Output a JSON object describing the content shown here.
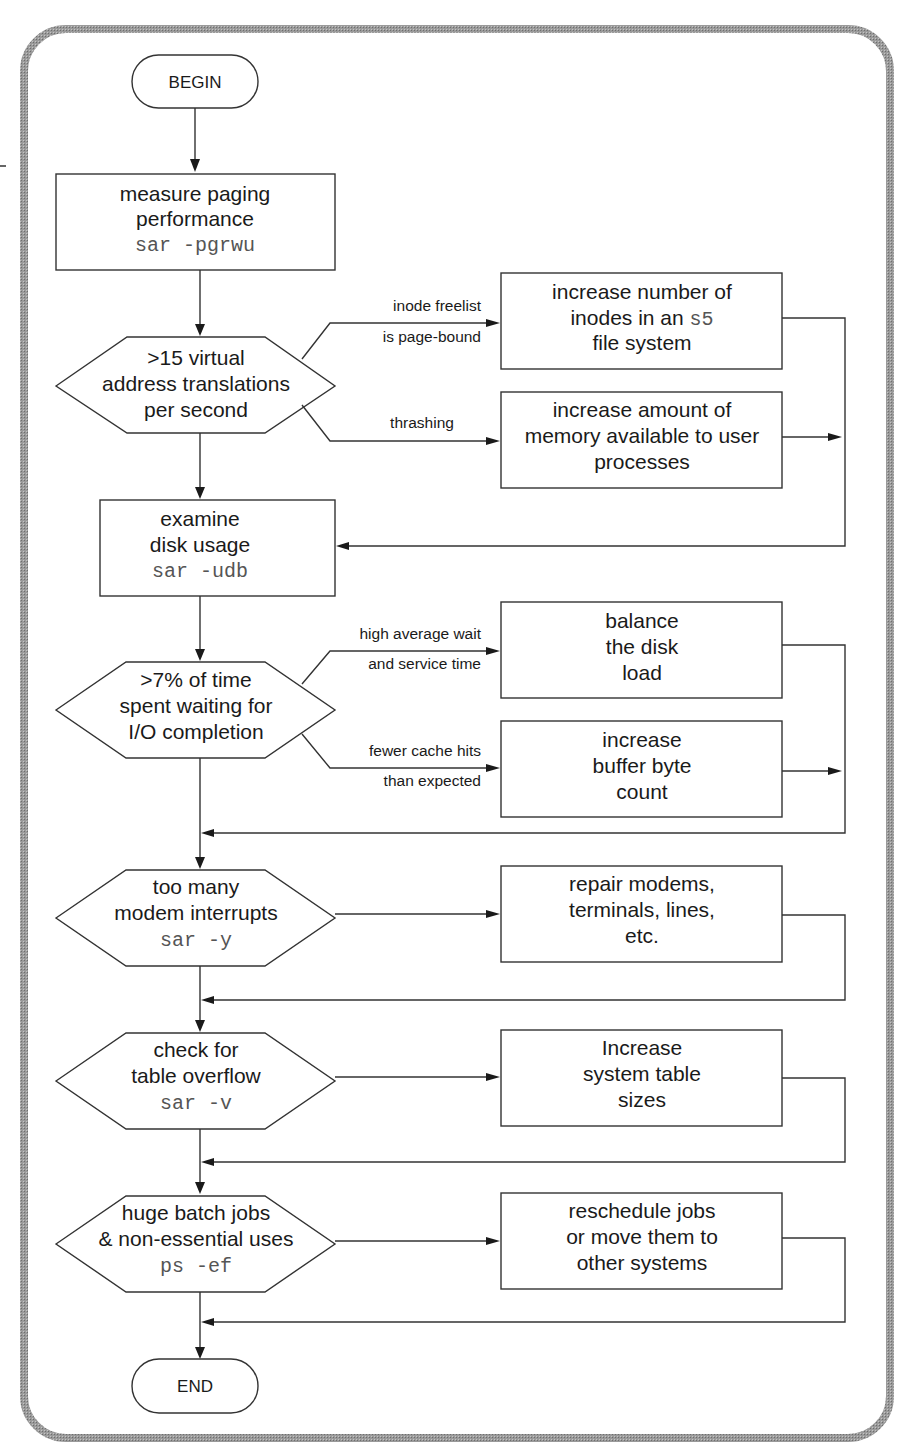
{
  "colors": {
    "frame": "#8a8a8a",
    "stroke": "#333333",
    "text": "#1a1a1a",
    "command_text": "#555555",
    "background": "#ffffff"
  },
  "flowchart": {
    "begin": "BEGIN",
    "end": "END",
    "steps": [
      {
        "id": "measure",
        "lines": [
          "measure paging",
          "performance"
        ],
        "command": "sar -pgrwu"
      },
      {
        "id": "decision1",
        "type": "decision",
        "lines": [
          ">15 virtual",
          "address translations",
          "per second"
        ]
      },
      {
        "id": "examine",
        "lines": [
          "examine",
          "disk usage"
        ],
        "command": "sar -udb"
      },
      {
        "id": "decision2",
        "type": "decision",
        "lines": [
          ">7% of time",
          "spent waiting for",
          "I/O completion"
        ]
      },
      {
        "id": "decision3",
        "type": "decision",
        "lines": [
          "too many",
          "modem interrupts"
        ],
        "command": "sar -y"
      },
      {
        "id": "decision4",
        "type": "decision",
        "lines": [
          "check for",
          "table overflow"
        ],
        "command": "sar -v"
      },
      {
        "id": "decision5",
        "type": "decision",
        "lines": [
          "huge batch jobs",
          "& non-essential uses"
        ],
        "command": "ps -ef"
      }
    ],
    "actions": [
      {
        "id": "inodes",
        "lines": [
          "increase number of",
          "inodes in an ",
          "file system"
        ],
        "inline_command": "s5"
      },
      {
        "id": "memory",
        "lines": [
          "increase amount of",
          "memory available to user",
          "processes"
        ]
      },
      {
        "id": "balance",
        "lines": [
          "balance",
          "the disk",
          "load"
        ]
      },
      {
        "id": "buffer",
        "lines": [
          "increase",
          "buffer byte",
          "count"
        ]
      },
      {
        "id": "modems",
        "lines": [
          "repair modems,",
          "terminals, lines,",
          "etc."
        ]
      },
      {
        "id": "tables",
        "lines": [
          "Increase",
          "system table",
          "sizes"
        ]
      },
      {
        "id": "reschedule",
        "lines": [
          "reschedule jobs",
          "or move them to",
          "other systems"
        ]
      }
    ],
    "edge_labels": {
      "inode_freelist": [
        "inode freelist",
        "is page-bound"
      ],
      "thrashing": [
        "thrashing"
      ],
      "high_wait": [
        "high average wait",
        "and service time"
      ],
      "cache_hits": [
        "fewer cache hits",
        "than expected"
      ]
    }
  }
}
